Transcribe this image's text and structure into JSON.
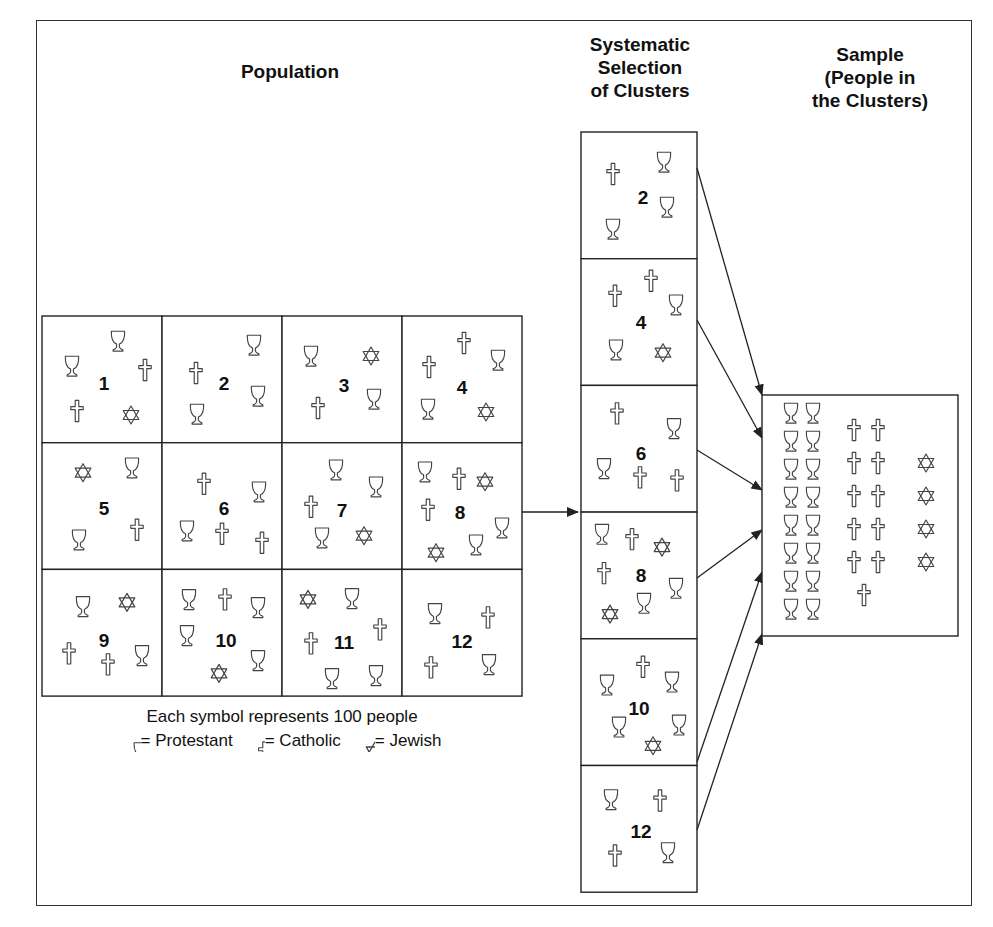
{
  "titles": {
    "population": "Population",
    "selection": "Systematic\nSelection\nof Clusters",
    "sample": "Sample\n(People in\nthe Clusters)"
  },
  "legend": {
    "caption": "Each symbol represents 100 people",
    "items": [
      {
        "icon": "chalice-icon",
        "label": "= Protestant"
      },
      {
        "icon": "cross-icon",
        "label": "= Catholic"
      },
      {
        "icon": "star-of-david-icon",
        "label": "= Jewish"
      }
    ]
  },
  "symbol_key": {
    "P": "Protestant (chalice)",
    "C": "Catholic (cross)",
    "J": "Jewish (Star of David)"
  },
  "population": {
    "rows": 3,
    "cols": 4,
    "clusters": [
      {
        "id": "1",
        "num_pos": [
          62,
          68
        ],
        "symbols": [
          {
            "t": "P",
            "x": 76,
            "y": 25
          },
          {
            "t": "P",
            "x": 30,
            "y": 50
          },
          {
            "t": "C",
            "x": 103,
            "y": 54
          },
          {
            "t": "C",
            "x": 35,
            "y": 95
          },
          {
            "t": "J",
            "x": 89,
            "y": 99
          }
        ]
      },
      {
        "id": "2",
        "num_pos": [
          62,
          68
        ],
        "symbols": [
          {
            "t": "P",
            "x": 92,
            "y": 29
          },
          {
            "t": "C",
            "x": 34,
            "y": 57
          },
          {
            "t": "P",
            "x": 96,
            "y": 80
          },
          {
            "t": "P",
            "x": 35,
            "y": 98
          }
        ]
      },
      {
        "id": "3",
        "num_pos": [
          62,
          70
        ],
        "symbols": [
          {
            "t": "P",
            "x": 29,
            "y": 40
          },
          {
            "t": "J",
            "x": 89,
            "y": 40
          },
          {
            "t": "C",
            "x": 36,
            "y": 92
          },
          {
            "t": "P",
            "x": 92,
            "y": 83
          }
        ]
      },
      {
        "id": "4",
        "num_pos": [
          60,
          72
        ],
        "symbols": [
          {
            "t": "C",
            "x": 62,
            "y": 27
          },
          {
            "t": "C",
            "x": 27,
            "y": 51
          },
          {
            "t": "P",
            "x": 96,
            "y": 44
          },
          {
            "t": "P",
            "x": 26,
            "y": 93
          },
          {
            "t": "J",
            "x": 84,
            "y": 96
          }
        ]
      },
      {
        "id": "5",
        "num_pos": [
          62,
          66
        ],
        "symbols": [
          {
            "t": "J",
            "x": 41,
            "y": 30
          },
          {
            "t": "P",
            "x": 90,
            "y": 25
          },
          {
            "t": "P",
            "x": 37,
            "y": 97
          },
          {
            "t": "C",
            "x": 95,
            "y": 87
          }
        ]
      },
      {
        "id": "6",
        "num_pos": [
          62,
          66
        ],
        "symbols": [
          {
            "t": "C",
            "x": 42,
            "y": 41
          },
          {
            "t": "P",
            "x": 97,
            "y": 49
          },
          {
            "t": "P",
            "x": 25,
            "y": 88
          },
          {
            "t": "C",
            "x": 60,
            "y": 91
          },
          {
            "t": "C",
            "x": 100,
            "y": 100
          }
        ]
      },
      {
        "id": "7",
        "num_pos": [
          60,
          68
        ],
        "symbols": [
          {
            "t": "P",
            "x": 54,
            "y": 27
          },
          {
            "t": "P",
            "x": 94,
            "y": 44
          },
          {
            "t": "C",
            "x": 29,
            "y": 64
          },
          {
            "t": "P",
            "x": 40,
            "y": 95
          },
          {
            "t": "J",
            "x": 82,
            "y": 93
          }
        ]
      },
      {
        "id": "8",
        "num_pos": [
          58,
          70
        ],
        "symbols": [
          {
            "t": "P",
            "x": 23,
            "y": 29
          },
          {
            "t": "C",
            "x": 57,
            "y": 36
          },
          {
            "t": "J",
            "x": 83,
            "y": 39
          },
          {
            "t": "C",
            "x": 26,
            "y": 67
          },
          {
            "t": "P",
            "x": 100,
            "y": 85
          },
          {
            "t": "J",
            "x": 34,
            "y": 110
          },
          {
            "t": "P",
            "x": 74,
            "y": 102
          }
        ]
      },
      {
        "id": "9",
        "num_pos": [
          62,
          72
        ],
        "symbols": [
          {
            "t": "P",
            "x": 41,
            "y": 37
          },
          {
            "t": "J",
            "x": 85,
            "y": 33
          },
          {
            "t": "C",
            "x": 27,
            "y": 84
          },
          {
            "t": "C",
            "x": 66,
            "y": 95
          },
          {
            "t": "P",
            "x": 100,
            "y": 86
          }
        ]
      },
      {
        "id": "10",
        "num_pos": [
          64,
          72
        ],
        "symbols": [
          {
            "t": "P",
            "x": 27,
            "y": 30
          },
          {
            "t": "C",
            "x": 63,
            "y": 30
          },
          {
            "t": "P",
            "x": 96,
            "y": 38
          },
          {
            "t": "P",
            "x": 25,
            "y": 66
          },
          {
            "t": "J",
            "x": 57,
            "y": 104
          },
          {
            "t": "P",
            "x": 96,
            "y": 91
          }
        ]
      },
      {
        "id": "11",
        "num_pos": [
          62,
          74
        ],
        "symbols": [
          {
            "t": "J",
            "x": 26,
            "y": 30
          },
          {
            "t": "P",
            "x": 70,
            "y": 29
          },
          {
            "t": "C",
            "x": 29,
            "y": 74
          },
          {
            "t": "C",
            "x": 98,
            "y": 60
          },
          {
            "t": "P",
            "x": 50,
            "y": 109
          },
          {
            "t": "P",
            "x": 94,
            "y": 106
          }
        ]
      },
      {
        "id": "12",
        "num_pos": [
          60,
          73
        ],
        "symbols": [
          {
            "t": "P",
            "x": 33,
            "y": 44
          },
          {
            "t": "C",
            "x": 86,
            "y": 48
          },
          {
            "t": "C",
            "x": 29,
            "y": 98
          },
          {
            "t": "P",
            "x": 87,
            "y": 95
          }
        ]
      }
    ]
  },
  "selection": {
    "clusters": [
      {
        "id": "2",
        "num_pos": [
          62,
          66
        ],
        "symbols": [
          {
            "t": "C",
            "x": 32,
            "y": 42
          },
          {
            "t": "P",
            "x": 83,
            "y": 30
          },
          {
            "t": "P",
            "x": 86,
            "y": 75
          },
          {
            "t": "P",
            "x": 32,
            "y": 97
          }
        ]
      },
      {
        "id": "4",
        "num_pos": [
          60,
          64
        ],
        "symbols": [
          {
            "t": "C",
            "x": 70,
            "y": 22
          },
          {
            "t": "C",
            "x": 34,
            "y": 37
          },
          {
            "t": "P",
            "x": 95,
            "y": 46
          },
          {
            "t": "P",
            "x": 35,
            "y": 91
          },
          {
            "t": "J",
            "x": 82,
            "y": 94
          }
        ]
      },
      {
        "id": "6",
        "num_pos": [
          60,
          69
        ],
        "symbols": [
          {
            "t": "C",
            "x": 36,
            "y": 28
          },
          {
            "t": "P",
            "x": 93,
            "y": 43
          },
          {
            "t": "P",
            "x": 23,
            "y": 83
          },
          {
            "t": "C",
            "x": 59,
            "y": 92
          },
          {
            "t": "C",
            "x": 96,
            "y": 95
          }
        ]
      },
      {
        "id": "8",
        "num_pos": [
          60,
          64
        ],
        "symbols": [
          {
            "t": "P",
            "x": 21,
            "y": 22
          },
          {
            "t": "C",
            "x": 51,
            "y": 27
          },
          {
            "t": "J",
            "x": 81,
            "y": 35
          },
          {
            "t": "C",
            "x": 23,
            "y": 61
          },
          {
            "t": "P",
            "x": 95,
            "y": 76
          },
          {
            "t": "J",
            "x": 29,
            "y": 102
          },
          {
            "t": "P",
            "x": 63,
            "y": 91
          }
        ]
      },
      {
        "id": "10",
        "num_pos": [
          58,
          70
        ],
        "symbols": [
          {
            "t": "C",
            "x": 62,
            "y": 28
          },
          {
            "t": "P",
            "x": 26,
            "y": 46
          },
          {
            "t": "P",
            "x": 91,
            "y": 43
          },
          {
            "t": "P",
            "x": 38,
            "y": 88
          },
          {
            "t": "P",
            "x": 98,
            "y": 86
          },
          {
            "t": "J",
            "x": 72,
            "y": 107
          }
        ]
      },
      {
        "id": "12",
        "num_pos": [
          60,
          66
        ],
        "symbols": [
          {
            "t": "P",
            "x": 30,
            "y": 34
          },
          {
            "t": "C",
            "x": 79,
            "y": 35
          },
          {
            "t": "C",
            "x": 34,
            "y": 90
          },
          {
            "t": "P",
            "x": 87,
            "y": 87
          }
        ]
      }
    ]
  },
  "sample": {
    "counts": {
      "Protestant": 16,
      "Catholic": 11,
      "Jewish": 4
    }
  }
}
